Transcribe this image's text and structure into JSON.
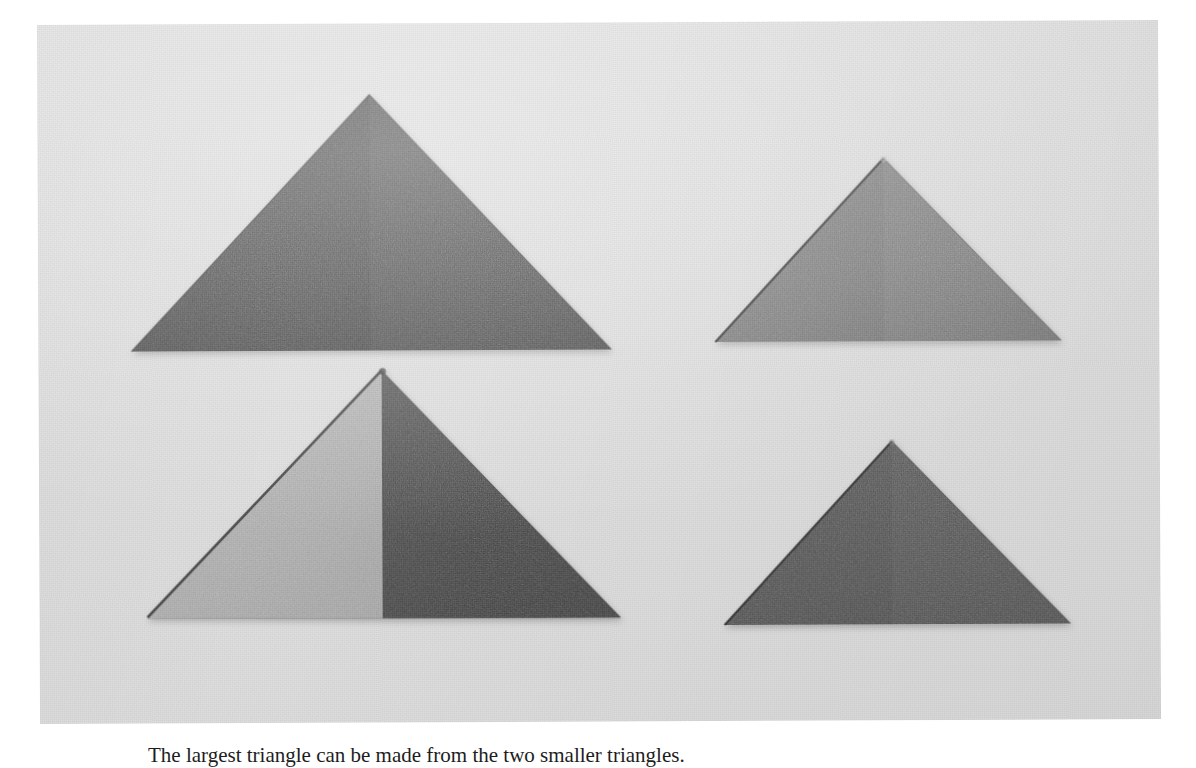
{
  "page": {
    "background_color": "#ffffff",
    "caption": "The largest triangle can be made from the two smaller triangles."
  },
  "photo": {
    "name": "triangles-photograph",
    "background_color": "#e3e3e3",
    "surface": "light gray card stock",
    "frame": {
      "left": 37,
      "top": 25,
      "width": 1121,
      "height": 699
    }
  },
  "shapes": [
    {
      "id": "large-dark-triangle",
      "label": "Large dark triangle (top left)",
      "position": "top-left",
      "fill": "#2e2e2e",
      "edge_color": "#1b1b1b",
      "seam": true,
      "apex": [
        369,
        96
      ],
      "base_left": [
        130,
        352
      ],
      "base_right": [
        610,
        352
      ],
      "width": 480,
      "height": 256
    },
    {
      "id": "medium-gray-triangle",
      "label": "Medium gray triangle (top right)",
      "position": "top-right",
      "fill": "#6e6e6e",
      "edge_color": "#303030",
      "seam": false,
      "apex": [
        883,
        162
      ],
      "base_left": [
        714,
        345
      ],
      "base_right": [
        1060,
        345
      ],
      "width": 346,
      "height": 183
    },
    {
      "id": "composite-triangle",
      "label": "Composite triangle: light half plus dark half (bottom left)",
      "position": "bottom-left",
      "fill_left": "#b5b5b5",
      "fill_right": "#3a3a3a",
      "edge_color": "#3b3b3b",
      "seam": true,
      "apex": [
        380,
        372
      ],
      "base_left": [
        145,
        618
      ],
      "base_right": [
        618,
        620
      ],
      "width": 473,
      "height": 248
    },
    {
      "id": "dark-gray-triangle",
      "label": "Dark gray triangle (bottom right)",
      "position": "bottom-right",
      "fill": "#4a4a4a",
      "edge_color": "#2a2a2a",
      "seam": true,
      "apex": [
        890,
        445
      ],
      "base_left": [
        722,
        628
      ],
      "base_right": [
        1068,
        628
      ],
      "width": 346,
      "height": 183
    }
  ],
  "colors": {
    "page_white": "#ffffff",
    "photo_background": "#e3e3e3",
    "darkest": "#2e2e2e",
    "dark": "#3a3a3a",
    "mid_dark": "#4a4a4a",
    "mid": "#6e6e6e",
    "light": "#b5b5b5"
  }
}
